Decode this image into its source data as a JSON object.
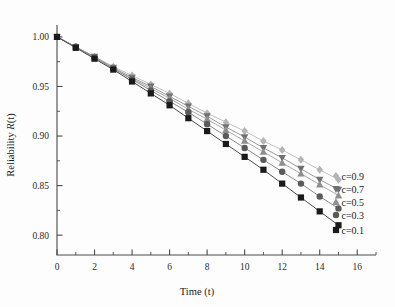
{
  "chart_data": {
    "type": "line",
    "title": "",
    "xlabel": "Time (t)",
    "ylabel": "Reliability R(t)",
    "ylabel_parts": {
      "prefix": "Reliability ",
      "italic": "R",
      "suffix": "(t)"
    },
    "xlim": [
      0,
      17
    ],
    "ylim": [
      0.78,
      1.012
    ],
    "grid": false,
    "legend_position": "right-inside",
    "x_ticks": [
      0,
      2,
      4,
      6,
      8,
      10,
      12,
      14,
      16
    ],
    "x_tick_labels": [
      "0",
      "2",
      "4",
      "6",
      "8",
      "10",
      "12",
      "14",
      "16"
    ],
    "x_minor_ticks": [
      1,
      3,
      5,
      7,
      9,
      11,
      13,
      15,
      17
    ],
    "y_ticks": [
      0.8,
      0.85,
      0.9,
      0.95,
      1.0
    ],
    "y_tick_labels": [
      "0.80",
      "0.85",
      "0.90",
      "0.95",
      "1.00"
    ],
    "y_minor_ticks": [
      0.825,
      0.875,
      0.925,
      0.975
    ],
    "x": [
      0,
      1,
      2,
      3,
      4,
      5,
      6,
      7,
      8,
      9,
      10,
      11,
      12,
      13,
      14,
      15
    ],
    "series": [
      {
        "name": "c=0.9",
        "label": "c=0.9",
        "marker": "diamond",
        "color": "#b4b4b4",
        "line_color": "#c2c2c2",
        "values": [
          1.0,
          0.99,
          0.98,
          0.97,
          0.961,
          0.952,
          0.943,
          0.933,
          0.923,
          0.914,
          0.905,
          0.895,
          0.886,
          0.876,
          0.866,
          0.856
        ]
      },
      {
        "name": "c=0.7",
        "label": "c=0.7",
        "marker": "triangle-down",
        "color": "#707070",
        "line_color": "#9a9a9a",
        "values": [
          1.0,
          0.99,
          0.98,
          0.969,
          0.959,
          0.95,
          0.94,
          0.93,
          0.92,
          0.909,
          0.899,
          0.888,
          0.878,
          0.867,
          0.856,
          0.846
        ]
      },
      {
        "name": "c=0.5",
        "label": "c=0.5",
        "marker": "triangle-up",
        "color": "#8e8e8e",
        "line_color": "#ababab",
        "values": [
          1.0,
          0.99,
          0.979,
          0.969,
          0.958,
          0.948,
          0.938,
          0.927,
          0.917,
          0.906,
          0.895,
          0.884,
          0.873,
          0.862,
          0.851,
          0.84
        ]
      },
      {
        "name": "c=0.3",
        "label": "c=0.3",
        "marker": "circle",
        "color": "#5a5a5a",
        "line_color": "#8a8a8a",
        "values": [
          1.0,
          0.99,
          0.979,
          0.968,
          0.957,
          0.946,
          0.935,
          0.924,
          0.912,
          0.9,
          0.888,
          0.876,
          0.864,
          0.852,
          0.839,
          0.827
        ]
      },
      {
        "name": "c=0.1",
        "label": "c=0.1",
        "marker": "square",
        "color": "#1a1a1a",
        "line_color": "#4a4a4a",
        "values": [
          1.0,
          0.989,
          0.978,
          0.967,
          0.955,
          0.943,
          0.931,
          0.918,
          0.905,
          0.892,
          0.879,
          0.866,
          0.852,
          0.838,
          0.824,
          0.81
        ]
      }
    ]
  },
  "colors": {
    "axis": "#4a4a4a",
    "text": "#1c1c1c",
    "background": "#fdfdfd"
  }
}
